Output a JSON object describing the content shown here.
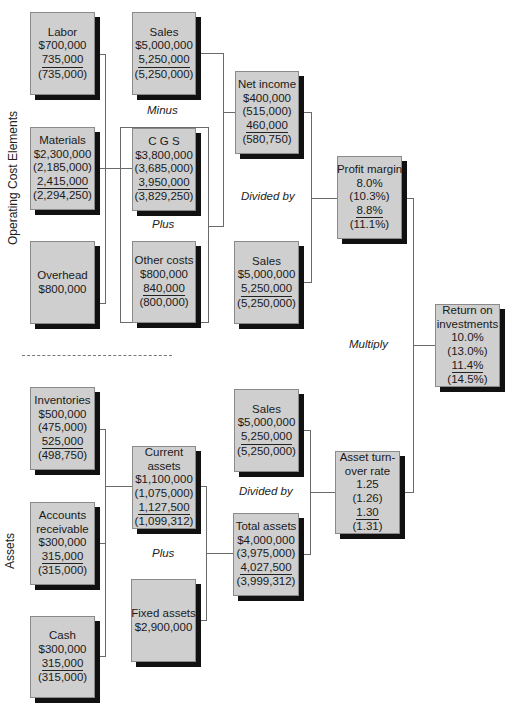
{
  "section_labels": {
    "top": "Operating Cost Elements",
    "bottom": "Assets"
  },
  "operators": {
    "minus": "Minus",
    "plus_top": "Plus",
    "divided_by_top": "Divided by",
    "multiply": "Multiply",
    "divided_by_bottom": "Divided by",
    "plus_bottom": "Plus"
  },
  "boxes": {
    "labor": {
      "title": "Labor",
      "values": [
        "$700,000",
        "735,000",
        "(735,000)"
      ]
    },
    "materials": {
      "title": "Materials",
      "values": [
        "$2,300,000",
        "(2,185,000)",
        "2,415,000",
        "(2,294,250)"
      ]
    },
    "overhead": {
      "title": "Overhead",
      "values": [
        "$800,000"
      ]
    },
    "sales_top": {
      "title": "Sales",
      "values": [
        "$5,000,000",
        "5,250,000",
        "(5,250,000)"
      ]
    },
    "cgs": {
      "title": "C G S",
      "values": [
        "$3,800,000",
        "(3,685,000)",
        "3,950,000",
        "(3,829,250)"
      ]
    },
    "other_costs": {
      "title": "Other costs",
      "values": [
        "$800,000",
        "840,000",
        "(800,000)"
      ]
    },
    "net_income": {
      "title": "Net income",
      "values": [
        "$400,000",
        "(515,000)",
        "460,000",
        "(580,750)"
      ]
    },
    "sales_mid": {
      "title": "Sales",
      "values": [
        "$5,000,000",
        "5,250,000",
        "(5,250,000)"
      ]
    },
    "profit_margin": {
      "title": "Profit margin",
      "values": [
        "8.0%",
        "(10.3%)",
        "8.8%",
        "(11.1%)"
      ]
    },
    "roi": {
      "title_line1": "Return on",
      "title_line2": "investments",
      "values": [
        "10.0%",
        "(13.0%)",
        "11.4%",
        "(14.5%)"
      ]
    },
    "inventories": {
      "title": "Inventories",
      "values": [
        "$500,000",
        "(475,000)",
        "525,000",
        "(498,750)"
      ]
    },
    "accounts_receivable": {
      "title_line1": "Accounts",
      "title_line2": "receivable",
      "values": [
        "$300,000",
        "315,000",
        "(315,000)"
      ]
    },
    "cash": {
      "title": "Cash",
      "values": [
        "$300,000",
        "315,000",
        "(315,000)"
      ]
    },
    "current_assets": {
      "title_line1": "Current",
      "title_line2": "assets",
      "values": [
        "$1,100,000",
        "(1,075,000)",
        "1,127,500",
        "(1,099,312)"
      ]
    },
    "fixed_assets": {
      "title": "Fixed assets",
      "values": [
        "$2,900,000"
      ]
    },
    "sales_bottom": {
      "title": "Sales",
      "values": [
        "$5,000,000",
        "5,250,000",
        "(5,250,000)"
      ]
    },
    "total_assets": {
      "title": "Total assets",
      "values": [
        "$4,000,000",
        "(3,975,000)",
        "4,027,500",
        "(3,999,312)"
      ]
    },
    "asset_turnover": {
      "title_line1": "Asset turn-",
      "title_line2": "over rate",
      "values": [
        "1.25",
        "(1.26)",
        "1.30",
        "(1.31)"
      ]
    }
  }
}
